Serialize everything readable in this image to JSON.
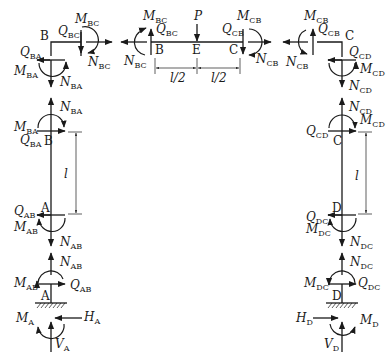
{
  "diagram": {
    "points": {
      "B_left": "B",
      "B_beam": "B",
      "E": "E",
      "C_beam": "C",
      "C_right": "C",
      "B_colL": "B",
      "A_colL": "A",
      "A_support": "A",
      "C_colR": "C",
      "D_colR": "D",
      "D_support": "D"
    },
    "dimensions": {
      "half1": "l/2",
      "half2": "l/2",
      "left_col": "l",
      "right_col": "l"
    },
    "load": {
      "symbol": "P",
      "sub": ""
    },
    "forces": {
      "M_BC_1": {
        "symbol": "M",
        "sub": "BC"
      },
      "Q_BC_1": {
        "symbol": "Q",
        "sub": "BC"
      },
      "N_BC_1": {
        "symbol": "N",
        "sub": "BC"
      },
      "Q_BA_1": {
        "symbol": "Q",
        "sub": "BA"
      },
      "M_BA_1": {
        "symbol": "M",
        "sub": "BA"
      },
      "N_BA_1": {
        "symbol": "N",
        "sub": "BA"
      },
      "M_BC_2": {
        "symbol": "M",
        "sub": "BC"
      },
      "Q_BC_2": {
        "symbol": "Q",
        "sub": "BC"
      },
      "N_BC_2": {
        "symbol": "N",
        "sub": "BC"
      },
      "M_CB_1": {
        "symbol": "M",
        "sub": "CB"
      },
      "Q_CB_1": {
        "symbol": "Q",
        "sub": "CB"
      },
      "N_CB_1": {
        "symbol": "N",
        "sub": "CB"
      },
      "M_CB_2": {
        "symbol": "M",
        "sub": "CB"
      },
      "Q_CB_2": {
        "symbol": "Q",
        "sub": "CB"
      },
      "N_CB_2": {
        "symbol": "N",
        "sub": "CB"
      },
      "Q_CD_1": {
        "symbol": "Q",
        "sub": "CD"
      },
      "M_CD_1": {
        "symbol": "M",
        "sub": "CD"
      },
      "N_CD_1": {
        "symbol": "N",
        "sub": "CD"
      },
      "N_BA_2": {
        "symbol": "N",
        "sub": "BA"
      },
      "M_BA_2": {
        "symbol": "M",
        "sub": "BA"
      },
      "Q_BA_2": {
        "symbol": "Q",
        "sub": "BA"
      },
      "N_CD_2": {
        "symbol": "N",
        "sub": "CD"
      },
      "M_CD_2": {
        "symbol": "M",
        "sub": "CD"
      },
      "Q_CD_2": {
        "symbol": "Q",
        "sub": "CD"
      },
      "Q_AB_1": {
        "symbol": "Q",
        "sub": "AB"
      },
      "M_AB_1": {
        "symbol": "M",
        "sub": "AB"
      },
      "N_AB_1": {
        "symbol": "N",
        "sub": "AB"
      },
      "Q_DC_1": {
        "symbol": "Q",
        "sub": "DC"
      },
      "M_DC_1": {
        "symbol": "M",
        "sub": "DC"
      },
      "N_DC_1": {
        "symbol": "N",
        "sub": "DC"
      },
      "N_AB_2": {
        "symbol": "N",
        "sub": "AB"
      },
      "M_AB_2": {
        "symbol": "M",
        "sub": "AB"
      },
      "Q_AB_2": {
        "symbol": "Q",
        "sub": "AB"
      },
      "N_DC_2": {
        "symbol": "N",
        "sub": "DC"
      },
      "M_DC_2": {
        "symbol": "M",
        "sub": "DC"
      },
      "Q_DC_2": {
        "symbol": "Q",
        "sub": "DC"
      },
      "M_A": {
        "symbol": "M",
        "sub": "A"
      },
      "H_A": {
        "symbol": "H",
        "sub": "A"
      },
      "V_A": {
        "symbol": "V",
        "sub": "A"
      },
      "H_D": {
        "symbol": "H",
        "sub": "D"
      },
      "M_D": {
        "symbol": "M",
        "sub": "D"
      },
      "V_D": {
        "symbol": "V",
        "sub": "D"
      }
    }
  }
}
